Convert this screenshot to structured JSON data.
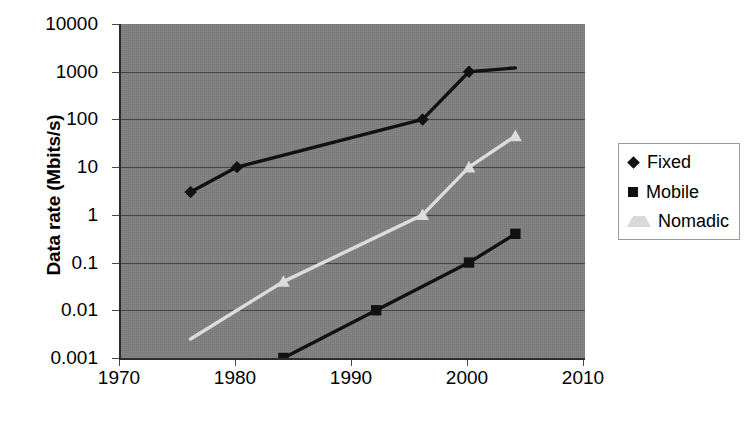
{
  "chart_data": {
    "type": "line",
    "title": "",
    "xlabel": "",
    "ylabel": "Data rate (Mbits/s)",
    "xlim": [
      1970,
      2010
    ],
    "ylim": [
      0.001,
      10000
    ],
    "yscale": "log",
    "xscale": "linear",
    "xticks": [
      1970,
      1980,
      1990,
      2000,
      2010
    ],
    "xticklabels": [
      "1970",
      "1980",
      "1990",
      "2000",
      "2010"
    ],
    "yticks": [
      10000,
      1000,
      100,
      10,
      1,
      0.1,
      0.01,
      0.001
    ],
    "yticklabels": [
      "10000",
      "1000",
      "100",
      "10",
      "1",
      "0.1",
      "0.01",
      "0.001"
    ],
    "grid": "horizontal",
    "plot_background": "#808080",
    "figure_background": "#ffffff",
    "legend_position": "right",
    "series": [
      {
        "name": "Fixed",
        "color": "#111111",
        "marker": "diamond",
        "x": [
          1976,
          1980,
          1996,
          2000,
          2004
        ],
        "y": [
          3,
          10,
          100,
          1000,
          1200
        ],
        "markers_shown": [
          true,
          true,
          true,
          true,
          false
        ]
      },
      {
        "name": "Mobile",
        "color": "#111111",
        "marker": "square",
        "x": [
          1984,
          1992,
          2000,
          2004
        ],
        "y": [
          0.001,
          0.01,
          0.1,
          0.4
        ],
        "markers_shown": [
          true,
          true,
          true,
          true
        ]
      },
      {
        "name": "Nomadic",
        "color": "#dcdcdc",
        "marker": "triangle",
        "x": [
          1976,
          1984,
          1996,
          2000,
          2004
        ],
        "y": [
          0.0025,
          0.04,
          1,
          10,
          45
        ],
        "markers_shown": [
          false,
          true,
          true,
          true,
          true
        ]
      }
    ]
  },
  "legend": {
    "items": [
      {
        "label": "Fixed",
        "marker": "diamond",
        "color": "#111111"
      },
      {
        "label": "Mobile",
        "marker": "square",
        "color": "#111111"
      },
      {
        "label": "Nomadic",
        "marker": "triangle",
        "color": "#d9d9d9"
      }
    ]
  },
  "axis": {
    "y_title": "Data rate (Mbits/s)"
  }
}
